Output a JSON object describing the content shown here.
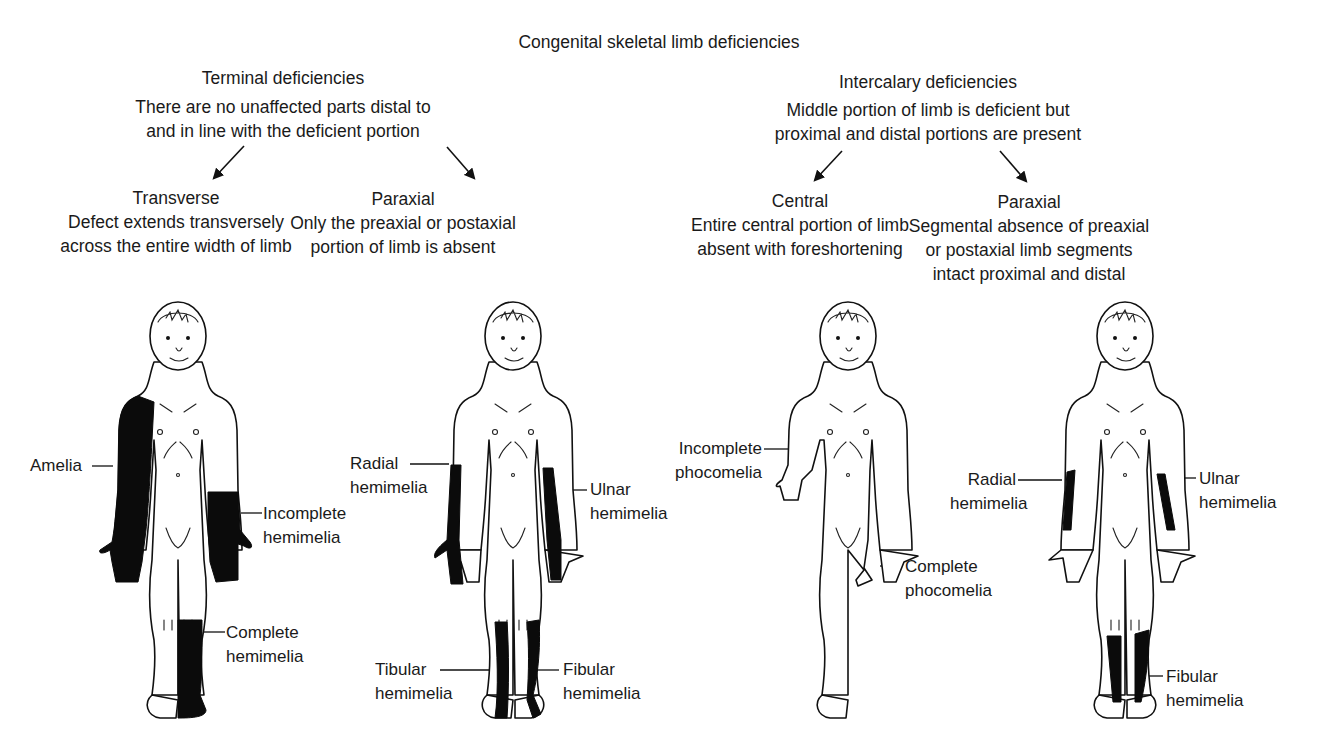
{
  "title": "Congenital skeletal limb deficiencies",
  "branches": [
    {
      "heading": "Terminal deficiencies",
      "description": [
        "There are no unaffected parts distal to",
        "and in line with the deficient portion"
      ],
      "subtypes": [
        {
          "heading": "Transverse",
          "description": [
            "Defect extends transversely",
            "across the entire width of limb"
          ],
          "labels": [
            {
              "lines": [
                "Amelia"
              ]
            },
            {
              "lines": [
                "Incomplete",
                "hemimelia"
              ]
            },
            {
              "lines": [
                "Complete",
                "hemimelia"
              ]
            }
          ]
        },
        {
          "heading": "Paraxial",
          "description": [
            "Only the preaxial or postaxial",
            "portion of limb is absent"
          ],
          "labels": [
            {
              "lines": [
                "Radial",
                "hemimelia"
              ]
            },
            {
              "lines": [
                "Ulnar",
                "hemimelia"
              ]
            },
            {
              "lines": [
                "Tibular",
                "hemimelia"
              ]
            },
            {
              "lines": [
                "Fibular",
                "hemimelia"
              ]
            }
          ]
        }
      ]
    },
    {
      "heading": "Intercalary deficiencies",
      "description": [
        "Middle portion of limb is deficient but",
        "proximal and distal portions are present"
      ],
      "subtypes": [
        {
          "heading": "Central",
          "description": [
            "Entire central portion of limb",
            "absent with foreshortening"
          ],
          "labels": [
            {
              "lines": [
                "Incomplete",
                "phocomelia"
              ]
            },
            {
              "lines": [
                "Complete",
                "phocomelia"
              ]
            }
          ]
        },
        {
          "heading": "Paraxial",
          "description": [
            "Segmental absence of preaxial",
            "or postaxial limb segments",
            "intact proximal and distal"
          ],
          "labels": [
            {
              "lines": [
                "Radial",
                "hemimelia"
              ]
            },
            {
              "lines": [
                "Ulnar",
                "hemimelia"
              ]
            },
            {
              "lines": [
                "Fibular",
                "hemimelia"
              ]
            }
          ]
        }
      ]
    }
  ],
  "colors": {
    "ink": "#111111",
    "deficiency_fill": "#0b0b0b",
    "background": "#ffffff"
  }
}
